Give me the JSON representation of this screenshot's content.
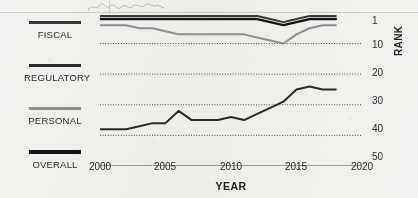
{
  "figure": {
    "background_color": "#f2f2f0",
    "ink_color": "#222222"
  },
  "legend": {
    "position": "left",
    "items": [
      {
        "label": "FISCAL",
        "color": "#3a3a3a",
        "swatch": "line-swatch"
      },
      {
        "label": "REGULATORY",
        "color": "#2b2b2b",
        "swatch": "line-swatch"
      },
      {
        "label": "PERSONAL",
        "color": "#8f8f8f",
        "swatch": "line-swatch"
      },
      {
        "label": "OVERALL",
        "color": "#141414",
        "swatch": "line-swatch"
      }
    ]
  },
  "axes": {
    "x_title": "YEAR",
    "y_title": "RANK",
    "x_ticks": [
      "2000",
      "2005",
      "2010",
      "2015",
      "2020"
    ],
    "y_ticks": [
      "1",
      "10",
      "20",
      "30",
      "40",
      "50"
    ]
  },
  "chart_data": {
    "type": "line",
    "title": "",
    "subtitle": "",
    "xlabel": "YEAR",
    "ylabel": "RANK",
    "xlim": [
      2000,
      2020
    ],
    "ylim": [
      1,
      50
    ],
    "y_inverted": true,
    "grid": "horizontal-dotted",
    "gridlines": [
      10,
      20,
      30,
      40,
      50
    ],
    "legend_position": "left",
    "x": [
      2000,
      2001,
      2002,
      2003,
      2004,
      2005,
      2006,
      2007,
      2008,
      2009,
      2010,
      2011,
      2012,
      2013,
      2014,
      2015,
      2016,
      2017,
      2018
    ],
    "series": [
      {
        "name": "OVERALL",
        "color": "#141414",
        "values": [
          2,
          2,
          2,
          2,
          2,
          2,
          2,
          2,
          2,
          2,
          2,
          2,
          2,
          3,
          4,
          3,
          2,
          2,
          2
        ]
      },
      {
        "name": "FISCAL",
        "color": "#3a3a3a",
        "values": [
          1,
          1,
          1,
          1,
          1,
          1,
          1,
          1,
          1,
          1,
          1,
          1,
          1,
          2,
          3,
          2,
          1,
          1,
          1
        ]
      },
      {
        "name": "PERSONAL",
        "color": "#8f8f8f",
        "values": [
          4,
          4,
          4,
          5,
          5,
          6,
          7,
          7,
          7,
          7,
          7,
          7,
          8,
          9,
          10,
          7,
          5,
          4,
          4
        ]
      },
      {
        "name": "REGULATORY",
        "color": "#2b2b2b",
        "values": [
          38,
          38,
          38,
          37,
          36,
          36,
          32,
          35,
          35,
          35,
          34,
          35,
          33,
          31,
          29,
          25,
          24,
          25,
          25
        ]
      }
    ],
    "annotations": []
  }
}
